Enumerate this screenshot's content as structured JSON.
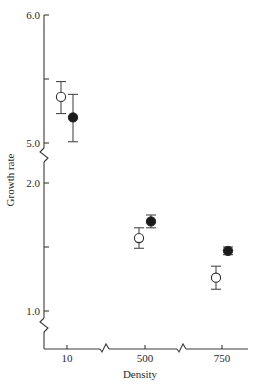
{
  "chart_data": {
    "type": "scatter",
    "title": "",
    "xlabel": "Density",
    "ylabel": "Growth rate",
    "categories": [
      "10",
      "500",
      "750"
    ],
    "x_axis_breaks": true,
    "y_axis_breaks": true,
    "y_panels": [
      {
        "range": [
          5.0,
          6.0
        ],
        "ticks": [
          5.0,
          5.5,
          6.0
        ],
        "tick_labels": [
          "5.0",
          "",
          "6.0"
        ]
      },
      {
        "range": [
          1.0,
          2.0
        ],
        "ticks": [
          1.0,
          1.5,
          2.0
        ],
        "tick_labels": [
          "1.0",
          "",
          "2.0"
        ]
      }
    ],
    "grid": false,
    "legend": null,
    "series": [
      {
        "name": "open",
        "marker": "open-circle",
        "values": [
          5.36,
          1.57,
          1.26
        ],
        "error_low": [
          5.23,
          1.49,
          1.17
        ],
        "error_high": [
          5.48,
          1.65,
          1.35
        ]
      },
      {
        "name": "filled",
        "marker": "filled-circle",
        "values": [
          5.2,
          1.7,
          1.47
        ],
        "error_low": [
          5.01,
          1.65,
          1.44
        ],
        "error_high": [
          5.38,
          1.75,
          1.5
        ]
      }
    ]
  },
  "labels": {
    "xlabel": "Density",
    "ylabel": "Growth rate",
    "xticks": [
      "10",
      "500",
      "750"
    ],
    "yticks": {
      "y6": "6.0",
      "y5": "5.0",
      "y2": "2.0",
      "y1": "1.0"
    }
  },
  "colors": {
    "axis": "#3a3a3a",
    "marker_fill": "#1a1a1a",
    "marker_open_fill": "#ffffff"
  }
}
